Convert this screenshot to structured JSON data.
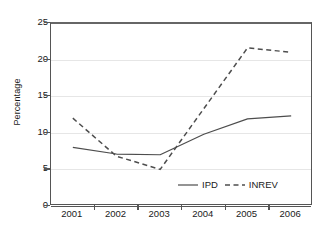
{
  "chart_data": {
    "type": "line",
    "title": "",
    "xlabel": "",
    "ylabel": "Percentage",
    "categories": [
      "2001",
      "2002",
      "2003",
      "2004",
      "2005",
      "2006"
    ],
    "x": [
      2001,
      2002,
      2003,
      2004,
      2005,
      2006
    ],
    "xlim": [
      2001,
      2006
    ],
    "ylim": [
      0,
      25
    ],
    "yticks": [
      0,
      5,
      10,
      15,
      20,
      25
    ],
    "ytick_labels": [
      "0",
      "5",
      "10",
      "15",
      "20",
      "25"
    ],
    "grid": "horizontal",
    "legend_position": "inside-bottom-right",
    "series": [
      {
        "name": "IPD",
        "style": "solid",
        "color": "#4d4d4d",
        "values": [
          8.0,
          7.1,
          7.0,
          9.8,
          11.9,
          12.3
        ]
      },
      {
        "name": "INREV",
        "style": "dashed",
        "color": "#4d4d4d",
        "values": [
          12.0,
          6.8,
          5.0,
          13.3,
          21.6,
          21.0
        ]
      }
    ]
  },
  "legend": {
    "entries": [
      {
        "label": "IPD",
        "style": "solid"
      },
      {
        "label": "INREV",
        "style": "dashed"
      }
    ]
  },
  "axes": {
    "y_title": "Percentage"
  }
}
